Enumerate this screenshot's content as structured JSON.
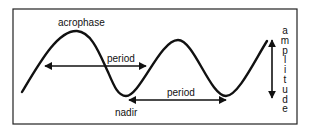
{
  "diagram": {
    "labels": {
      "acrophase": "acrophase",
      "nadir": "nadir",
      "period_1": "period",
      "period_2": "period",
      "amplitude": "amplitude"
    },
    "colors": {
      "stroke": "#111111",
      "background": "#ffffff",
      "frame": "#222222"
    }
  }
}
